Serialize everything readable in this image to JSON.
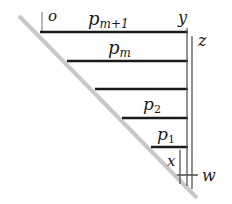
{
  "diagram": {
    "colors": {
      "ink": "#1a1a1a",
      "diagonal": "#c8c8c8",
      "vertical": "#555555"
    },
    "labels": {
      "origin": "o",
      "y": "y",
      "z": "z",
      "x": "x",
      "w": "w",
      "p_top_base": "p",
      "p_top_sub": "m+1",
      "p_m_base": "p",
      "p_m_sub": "m",
      "p2_base": "p",
      "p2_sub": "2",
      "p1_base": "p",
      "p1_sub": "1"
    },
    "horizontal_lines": [
      {
        "y": 32,
        "x1": 40,
        "x2": 188,
        "label": "p_{m+1}"
      },
      {
        "y": 61,
        "x1": 67,
        "x2": 188,
        "label": "p_m"
      },
      {
        "y": 89,
        "x1": 95,
        "x2": 188,
        "label": ""
      },
      {
        "y": 118,
        "x1": 122,
        "x2": 188,
        "label": "p_2"
      },
      {
        "y": 147,
        "x1": 151,
        "x2": 188,
        "label": "p_1"
      }
    ]
  }
}
